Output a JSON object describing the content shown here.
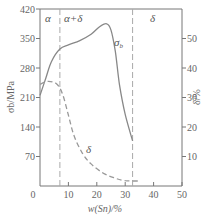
{
  "chart_data": {
    "type": "line",
    "title": "",
    "xlabel": "w(Sn)/%",
    "ylabel": "σb/MPa",
    "ylabel_right": "δ/%",
    "xlim": [
      0,
      50
    ],
    "ylim": [
      0,
      420
    ],
    "ylim_right": [
      0,
      60
    ],
    "x_ticks": [
      "0",
      "10",
      "20",
      "30",
      "40",
      "50"
    ],
    "y_ticks": [
      "70",
      "140",
      "210",
      "280",
      "350",
      "420"
    ],
    "y_ticks_right": [
      "10",
      "20",
      "30",
      "40",
      "50"
    ],
    "grid": false,
    "regions": [
      {
        "label": "α",
        "x_range": [
          0,
          7
        ]
      },
      {
        "label": "α+δ",
        "x_range": [
          7,
          32.6
        ]
      },
      {
        "label": "δ",
        "x_range": [
          32.6,
          50
        ]
      }
    ],
    "boundaries_x": [
      7,
      32.6
    ],
    "series": [
      {
        "name": "σb",
        "axis": "left",
        "style": "solid",
        "x": [
          0,
          2,
          4,
          7,
          10,
          14,
          18,
          21,
          23.5,
          25,
          26.5,
          28,
          30,
          32.6
        ],
        "values": [
          215,
          255,
          295,
          325,
          335,
          345,
          360,
          378,
          385,
          370,
          320,
          240,
          170,
          107
        ]
      },
      {
        "name": "δ",
        "axis": "right",
        "style": "dashed",
        "x": [
          0,
          3,
          6,
          8,
          10,
          12,
          15,
          18,
          22,
          26,
          30,
          35
        ],
        "values": [
          34.5,
          35.5,
          34.5,
          31,
          24,
          17,
          11,
          7.5,
          4.5,
          2.8,
          1.8,
          1.7
        ]
      }
    ],
    "annotations": [
      "σb",
      "δ"
    ]
  },
  "labels": {
    "x_axis_title": "w(Sn)/%",
    "y_axis_title": "σb/MPa",
    "y_axis_right_title": "δ/%",
    "region_alpha": "α",
    "region_alpha_delta": "α+δ",
    "region_delta": "δ",
    "curve_sigma_label": "σ",
    "curve_sigma_sub": "b",
    "curve_delta_label": "δ"
  },
  "colors": {
    "axis": "#777777",
    "curve": "#888888",
    "dashed": "#aaaaaa"
  }
}
